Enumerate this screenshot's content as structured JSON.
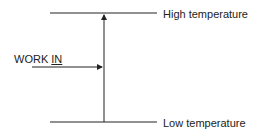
{
  "diagram": {
    "high_label": "High temperature",
    "low_label": "Low temperature",
    "work_label_prefix": "WORK ",
    "work_label_underlined": "IN",
    "line_color": "#222222"
  }
}
